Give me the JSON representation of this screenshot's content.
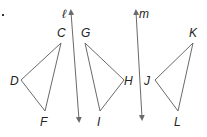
{
  "diagram": {
    "type": "geometry-reflection",
    "lines": [
      {
        "id": "l",
        "label": "ℓ",
        "from": [
          71,
          12
        ],
        "to": [
          79,
          120
        ],
        "label_pos": [
          62,
          18
        ]
      },
      {
        "id": "m",
        "label": "m",
        "from": [
          136,
          12
        ],
        "to": [
          142,
          118
        ],
        "label_pos": [
          139,
          18
        ]
      }
    ],
    "triangles": [
      {
        "id": "CDF",
        "vertices": [
          {
            "label": "C",
            "x": 61,
            "y": 43,
            "label_x": 57,
            "label_y": 37
          },
          {
            "label": "D",
            "x": 21,
            "y": 80,
            "label_x": 10,
            "label_y": 85
          },
          {
            "label": "F",
            "x": 45,
            "y": 111,
            "label_x": 40,
            "label_y": 126
          }
        ]
      },
      {
        "id": "GHI",
        "vertices": [
          {
            "label": "G",
            "x": 85,
            "y": 43,
            "label_x": 81,
            "label_y": 37
          },
          {
            "label": "H",
            "x": 124,
            "y": 80,
            "label_x": 124,
            "label_y": 85
          },
          {
            "label": "I",
            "x": 100,
            "y": 111,
            "label_x": 97,
            "label_y": 126
          }
        ]
      },
      {
        "id": "JKL",
        "vertices": [
          {
            "label": "J",
            "x": 155,
            "y": 80,
            "label_x": 144,
            "label_y": 85
          },
          {
            "label": "K",
            "x": 193,
            "y": 43,
            "label_x": 189,
            "label_y": 37
          },
          {
            "label": "L",
            "x": 178,
            "y": 111,
            "label_x": 174,
            "label_y": 126
          }
        ]
      }
    ],
    "bullet": {
      "x": 2,
      "y": 14
    }
  }
}
